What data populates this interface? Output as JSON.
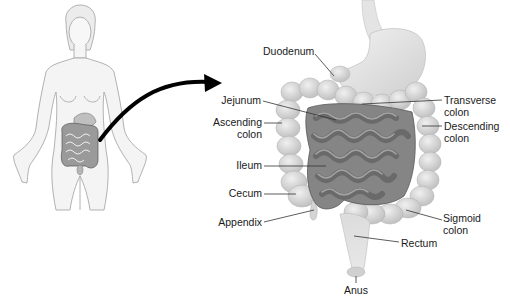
{
  "diagram": {
    "figure_overview": "female-body-outline",
    "labels": {
      "duodenum": {
        "line1": "Duodenum"
      },
      "jejunum": {
        "line1": "Jejunum"
      },
      "ascending_colon": {
        "line1": "Ascending",
        "line2": "colon"
      },
      "ileum": {
        "line1": "Ileum"
      },
      "cecum": {
        "line1": "Cecum"
      },
      "appendix": {
        "line1": "Appendix"
      },
      "transverse_colon": {
        "line1": "Transverse",
        "line2": "colon"
      },
      "descending_colon": {
        "line1": "Descending",
        "line2": "colon"
      },
      "sigmoid_colon": {
        "line1": "Sigmoid",
        "line2": "colon"
      },
      "rectum": {
        "line1": "Rectum"
      },
      "anus": {
        "line1": "Anus"
      }
    },
    "colors": {
      "background": "#ffffff",
      "body_fill": "#f2f2f2",
      "body_stroke": "#a8a8a8",
      "colon_fill": "#d6d6d6",
      "small_intestine_fill": "#7d7d7d",
      "stomach_fill": "#e0e0e0",
      "leader_line": "#333333",
      "arrow": "#000000",
      "text": "#1a1a1a"
    }
  }
}
